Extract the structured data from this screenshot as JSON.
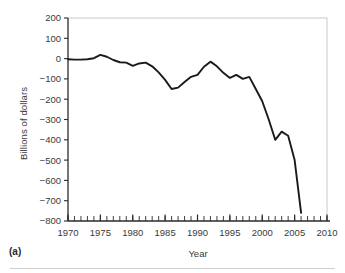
{
  "figure": {
    "panel_caption": "(a)"
  },
  "chart_data": {
    "type": "line",
    "title": "",
    "xlabel": "Year",
    "ylabel": "Billions of dollars",
    "xlim": [
      1970,
      2010
    ],
    "ylim": [
      -800,
      200
    ],
    "grid": false,
    "legend": "none",
    "x_ticks": [
      "1970",
      "1975",
      "1980",
      "1985",
      "1990",
      "1995",
      "2000",
      "2005",
      "2010"
    ],
    "x_tick_values": [
      1970,
      1975,
      1980,
      1985,
      1990,
      1995,
      2000,
      2005,
      2010
    ],
    "x_minor_tick_step": 1,
    "y_ticks": [
      "200",
      "100",
      "0",
      "-100",
      "-200",
      "-300",
      "-400",
      "-500",
      "-600",
      "-700",
      "-800"
    ],
    "y_tick_values": [
      200,
      100,
      0,
      -100,
      -200,
      -300,
      -400,
      -500,
      -600,
      -700,
      -800
    ],
    "series": [
      {
        "name": "Federal budget surplus or deficit",
        "color": "#1a1a1a",
        "x": [
          1970,
          1971,
          1972,
          1973,
          1974,
          1975,
          1976,
          1977,
          1978,
          1979,
          1980,
          1981,
          1982,
          1983,
          1984,
          1985,
          1986,
          1987,
          1988,
          1989,
          1990,
          1991,
          1992,
          1993,
          1994,
          1995,
          1996,
          1997,
          1998,
          1999,
          2000,
          2001,
          2002,
          2003,
          2004,
          2005,
          2006
        ],
        "values": [
          -3,
          -5,
          -5,
          -3,
          2,
          18,
          9,
          -7,
          -18,
          -20,
          -36,
          -24,
          -20,
          -38,
          -68,
          -105,
          -150,
          -143,
          -115,
          -90,
          -80,
          -40,
          -15,
          -38,
          -70,
          -95,
          -80,
          -100,
          -90,
          -150,
          -210,
          -300,
          -400,
          -360,
          -380,
          -500,
          -760
        ]
      }
    ]
  }
}
